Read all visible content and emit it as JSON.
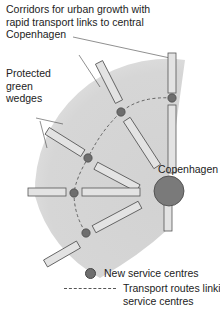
{
  "labels": {
    "corridors": "Corridors for urban growth with rapid transport links to central Copenhagen",
    "corridors_lines": [
      "Corridors for urban growth with",
      "rapid transport links to central",
      "Copenhagen"
    ],
    "wedges_lines": [
      "Protected",
      "green",
      "wedges"
    ],
    "city": "Copenhagen"
  },
  "legend": {
    "items": [
      {
        "symbol": "dark-circle",
        "label": "New service centres"
      },
      {
        "symbol": "dashed-line",
        "label_lines": [
          "Transport routes linking",
          "service centres"
        ]
      }
    ]
  },
  "colors": {
    "fan": "#d4d4d4",
    "corridor_fill": "#e3e3e3",
    "corridor_stroke": "#555555",
    "service_centre": "#6e6e6e",
    "city": "#7a7a7a",
    "route": "#555555"
  }
}
